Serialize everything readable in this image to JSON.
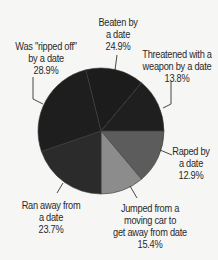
{
  "chart_data": {
    "type": "pie",
    "title": "",
    "legend": "none (direct labels with leader lines)",
    "note": "Stated percentages sum to 119.6%; slices drawn by visual angle",
    "slices": [
      {
        "name": "Beaten by a date",
        "value": 24.9,
        "label_lines": [
          "Beaten by",
          "a date",
          "24.9%"
        ],
        "color": "#1c1c1c",
        "start": -14,
        "end": 40
      },
      {
        "name": "Threatened with a weapon by a date",
        "value": 13.8,
        "label_lines": [
          "Threatened with a",
          "weapon by a date",
          "13.8%"
        ],
        "color": "#1f1f1f",
        "start": 40,
        "end": 90
      },
      {
        "name": "Raped by a date",
        "value": 12.9,
        "label_lines": [
          "Raped by",
          "a date",
          "12.9%"
        ],
        "color": "#5c5c5c",
        "start": 90,
        "end": 140
      },
      {
        "name": "Jumped from a moving car to get away from date",
        "value": 15.4,
        "label_lines": [
          "Jumped from a",
          "moving car to",
          "get away from date",
          "15.4%"
        ],
        "color": "#8c8c8c",
        "start": 140,
        "end": 180
      },
      {
        "name": "Ran away from a date",
        "value": 23.7,
        "label_lines": [
          "Ran away from",
          "a date",
          "23.7%"
        ],
        "color": "#2b2b2b",
        "start": 180,
        "end": 251
      },
      {
        "name": "Was \"ripped off\" by a date",
        "value": 28.9,
        "label_lines": [
          "Was \"ripped off\"",
          "by a date",
          "28.9%"
        ],
        "color": "#1e1e1e",
        "start": 251,
        "end": 346
      }
    ],
    "geometry": {
      "cx": 101,
      "cy": 131,
      "r": 63
    },
    "separator_color": "#3a3a3a"
  },
  "labels": {
    "beaten": {
      "l1": "Beaten by",
      "l2": "a date",
      "l3": "24.9%"
    },
    "threatened": {
      "l1": "Threatened with a",
      "l2": "weapon by a date",
      "l3": "13.8%"
    },
    "raped": {
      "l1": "Raped by",
      "l2": "a date",
      "l3": "12.9%"
    },
    "jumped": {
      "l1": "Jumped from a",
      "l2": "moving car to",
      "l3": "get away from date",
      "l4": "15.4%"
    },
    "ranaway": {
      "l1": "Ran away from",
      "l2": "a date",
      "l3": "23.7%"
    },
    "rippedoff": {
      "l1": "Was \"ripped off\"",
      "l2": "by a date",
      "l3": "28.9%"
    }
  }
}
